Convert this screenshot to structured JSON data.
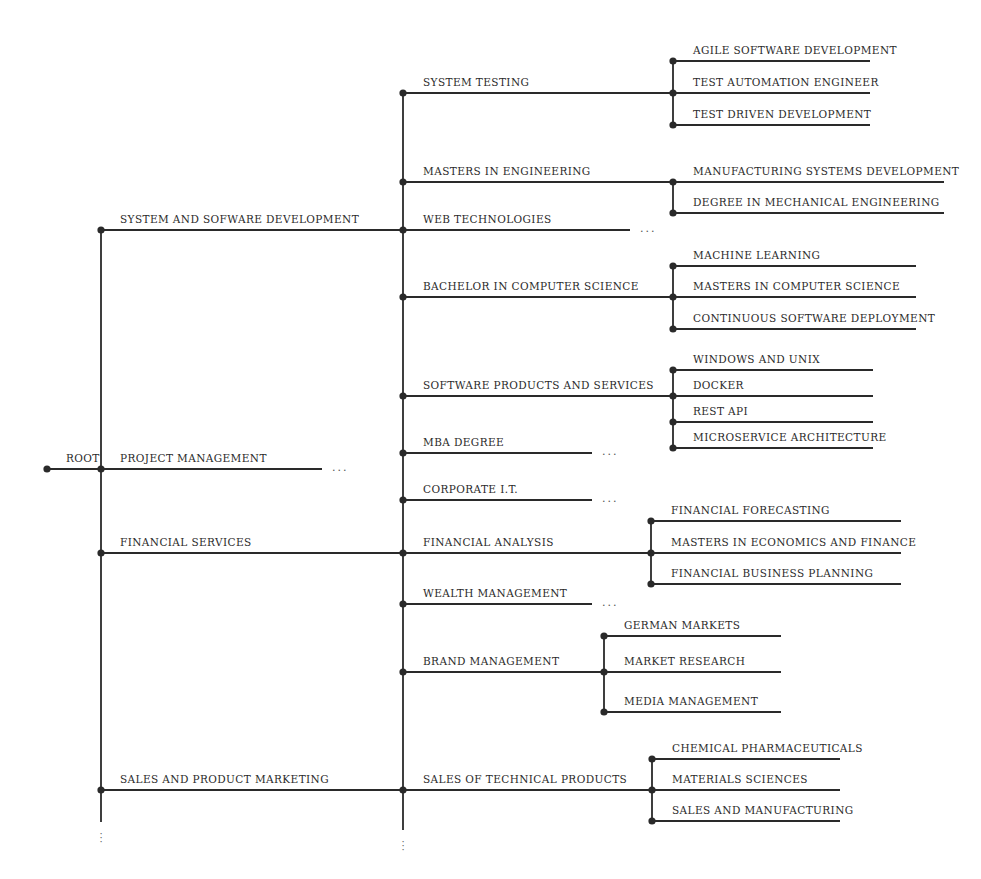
{
  "diagram": {
    "type": "tree",
    "root": {
      "label": "ROOT",
      "x": 47,
      "y": 469
    },
    "line_color": "#2a2a2a",
    "branches": [
      {
        "label": "SYSTEM AND SOFWARE DEVELOPMENT",
        "y": 230,
        "children": [
          {
            "label": "SYSTEM TESTING",
            "y": 93,
            "end_x": 673,
            "children": [
              {
                "label": "AGILE SOFTWARE DEVELOPMENT",
                "y": 61
              },
              {
                "label": "TEST AUTOMATION ENGINEER",
                "y": 93
              },
              {
                "label": "TEST DRIVEN DEVELOPMENT",
                "y": 125
              }
            ]
          },
          {
            "label": "MASTERS IN ENGINEERING",
            "y": 182,
            "end_x": 673,
            "children": [
              {
                "label": "MANUFACTURING SYSTEMS DEVELOPMENT",
                "y": 182
              },
              {
                "label": "DEGREE IN MECHANICAL ENGINEERING",
                "y": 213
              }
            ]
          },
          {
            "label": "WEB TECHNOLOGIES",
            "y": 230,
            "end_x": 630,
            "truncated": true,
            "ellipsis": "..."
          },
          {
            "label": "BACHELOR IN COMPUTER SCIENCE",
            "y": 297,
            "end_x": 673,
            "children": [
              {
                "label": "MACHINE LEARNING",
                "y": 266
              },
              {
                "label": "MASTERS IN COMPUTER SCIENCE",
                "y": 297
              },
              {
                "label": "CONTINUOUS SOFTWARE DEPLOYMENT",
                "y": 329
              }
            ]
          },
          {
            "label": "SOFTWARE PRODUCTS AND SERVICES",
            "y": 396,
            "end_x": 673,
            "children": [
              {
                "label": "WINDOWS AND UNIX",
                "y": 370
              },
              {
                "label": "DOCKER",
                "y": 396
              },
              {
                "label": "REST API",
                "y": 422
              },
              {
                "label": "MICROSERVICE ARCHITECTURE",
                "y": 448
              }
            ]
          }
        ]
      },
      {
        "label": "PROJECT MANAGEMENT",
        "y": 469,
        "truncated": true,
        "ellipsis": "...",
        "children": [
          {
            "label": "MBA DEGREE",
            "y": 453,
            "end_x": 592,
            "truncated": true,
            "ellipsis": "..."
          },
          {
            "label": "CORPORATE I.T.",
            "y": 500,
            "end_x": 592,
            "truncated": true,
            "ellipsis": "..."
          }
        ]
      },
      {
        "label": "FINANCIAL SERVICES",
        "y": 553,
        "children": [
          {
            "label": "FINANCIAL ANALYSIS",
            "y": 553,
            "end_x": 651,
            "children": [
              {
                "label": "FINANCIAL FORECASTING",
                "y": 521
              },
              {
                "label": "MASTERS IN ECONOMICS AND FINANCE",
                "y": 553
              },
              {
                "label": "FINANCIAL BUSINESS PLANNING",
                "y": 584
              }
            ]
          },
          {
            "label": "WEALTH MANAGEMENT",
            "y": 604,
            "end_x": 592,
            "truncated": true,
            "ellipsis": "..."
          }
        ]
      },
      {
        "label": "SALES AND PRODUCT MARKETING",
        "y": 790,
        "more_below": true,
        "children": [
          {
            "label": "BRAND MANAGEMENT",
            "y": 672,
            "end_x": 604,
            "children": [
              {
                "label": "GERMAN MARKETS",
                "y": 636
              },
              {
                "label": "MARKET RESEARCH",
                "y": 672
              },
              {
                "label": "MEDIA MANAGEMENT",
                "y": 712
              }
            ]
          },
          {
            "label": "SALES OF TECHNICAL PRODUCTS",
            "y": 790,
            "end_x": 652,
            "children": [
              {
                "label": "CHEMICAL PHARMACEUTICALS",
                "y": 759
              },
              {
                "label": "MATERIALS SCIENCES",
                "y": 790
              },
              {
                "label": "SALES AND MANUFACTURING",
                "y": 821
              }
            ]
          }
        ]
      }
    ],
    "more_below_marker": "⋮"
  }
}
